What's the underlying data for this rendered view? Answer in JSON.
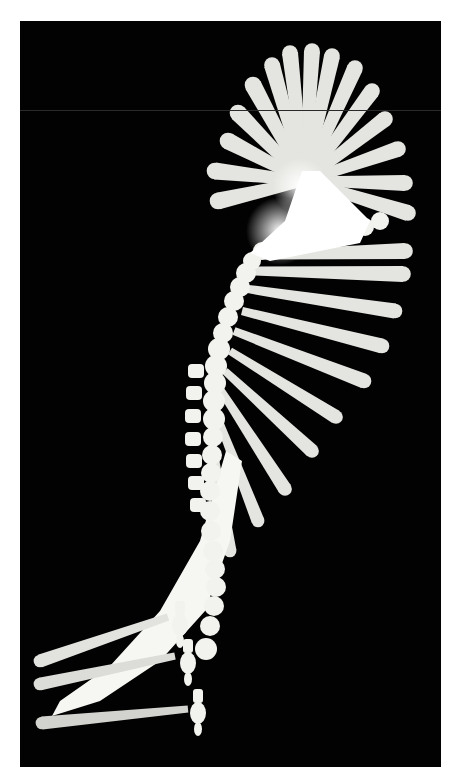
{
  "image": {
    "description": "Stroboscopic multiple-exposure photograph of a swinging hammer on black background",
    "frame": {
      "border_color": "#ffffff",
      "background_color": "#020202",
      "left": 20,
      "top": 21,
      "width": 421,
      "height": 746
    },
    "colors": {
      "handle": "#e4e4e0",
      "handle_bright": "#f6f6f2",
      "head": "#f2f2ee",
      "glow": "#ffffff",
      "lower_handle": "#d6d6d2"
    }
  },
  "shapes": {
    "upper_fan": {
      "hub": [
        285,
        160
      ],
      "handles": [
        {
          "end": [
            198,
            180
          ],
          "w": 17
        },
        {
          "end": [
            195,
            150
          ],
          "w": 17
        },
        {
          "end": [
            208,
            120
          ],
          "w": 17
        },
        {
          "end": [
            218,
            92
          ],
          "w": 17
        },
        {
          "end": [
            233,
            64
          ],
          "w": 17
        },
        {
          "end": [
            252,
            44
          ],
          "w": 16
        },
        {
          "end": [
            270,
            32
          ],
          "w": 16
        },
        {
          "end": [
            292,
            30
          ],
          "w": 16
        },
        {
          "end": [
            312,
            35
          ],
          "w": 16
        },
        {
          "end": [
            335,
            47
          ],
          "w": 16
        },
        {
          "end": [
            352,
            70
          ],
          "w": 16
        },
        {
          "end": [
            365,
            98
          ],
          "w": 16
        },
        {
          "end": [
            378,
            128
          ],
          "w": 16
        },
        {
          "end": [
            385,
            162
          ],
          "w": 16
        },
        {
          "end": [
            388,
            192
          ],
          "w": 16
        }
      ]
    },
    "lower_fan": {
      "handles": [
        {
          "start": [
            240,
            234
          ],
          "end": [
            385,
            230
          ],
          "w": 16
        },
        {
          "start": [
            235,
            250
          ],
          "end": [
            383,
            253
          ],
          "w": 16
        },
        {
          "start": [
            228,
            268
          ],
          "end": [
            375,
            290
          ],
          "w": 15
        },
        {
          "start": [
            222,
            290
          ],
          "end": [
            362,
            325
          ],
          "w": 15
        },
        {
          "start": [
            214,
            310
          ],
          "end": [
            344,
            360
          ],
          "w": 15
        },
        {
          "start": [
            210,
            330
          ],
          "end": [
            316,
            396
          ],
          "w": 14
        },
        {
          "start": [
            205,
            350
          ],
          "end": [
            292,
            430
          ],
          "w": 14
        },
        {
          "start": [
            200,
            368
          ],
          "end": [
            265,
            468
          ],
          "w": 14
        },
        {
          "start": [
            195,
            390
          ],
          "end": [
            238,
            500
          ],
          "w": 13
        },
        {
          "start": [
            192,
            420
          ],
          "end": [
            210,
            530
          ],
          "w": 13
        }
      ]
    },
    "head_chain": [
      [
        360,
        200,
        9
      ],
      [
        345,
        206,
        9
      ],
      [
        330,
        210,
        9
      ],
      [
        315,
        212,
        9
      ],
      [
        300,
        214,
        9
      ],
      [
        286,
        215,
        9
      ],
      [
        270,
        218,
        9
      ],
      [
        255,
        222,
        9
      ],
      [
        242,
        230,
        9
      ],
      [
        232,
        240,
        9
      ],
      [
        226,
        252,
        10
      ],
      [
        220,
        266,
        10
      ],
      [
        214,
        280,
        10
      ],
      [
        208,
        296,
        10
      ],
      [
        203,
        312,
        10
      ],
      [
        199,
        328,
        11
      ],
      [
        196,
        345,
        11
      ],
      [
        195,
        362,
        11
      ],
      [
        194,
        380,
        11
      ],
      [
        194,
        398,
        11
      ],
      [
        193,
        416,
        10
      ],
      [
        192,
        434,
        10
      ],
      [
        191,
        452,
        10
      ],
      [
        190,
        470,
        10
      ],
      [
        190,
        490,
        10
      ],
      [
        191,
        510,
        10
      ],
      [
        193,
        530,
        10
      ],
      [
        195,
        548,
        10
      ],
      [
        196,
        566,
        10
      ],
      [
        194,
        585,
        10
      ],
      [
        190,
        605,
        10
      ],
      [
        186,
        628,
        11
      ]
    ],
    "head_nubs": [
      [
        178,
        350
      ],
      [
        176,
        372
      ],
      [
        175,
        395
      ],
      [
        175,
        418
      ],
      [
        176,
        440
      ],
      [
        178,
        462
      ],
      [
        180,
        484
      ]
    ],
    "sweep_band": {
      "points": [
        [
          206,
          430
        ],
        [
          180,
          520
        ],
        [
          140,
          590
        ],
        [
          90,
          645
        ],
        [
          40,
          680
        ],
        [
          32,
          695
        ],
        [
          80,
          680
        ],
        [
          140,
          640
        ],
        [
          185,
          590
        ],
        [
          210,
          520
        ],
        [
          222,
          440
        ]
      ]
    },
    "bottom_hammers": [
      {
        "handle_start": [
          22,
          702
        ],
        "handle_end": [
          168,
          688
        ],
        "w": 13,
        "head": [
          178,
          692
        ],
        "color": "#d2d2ce"
      },
      {
        "handle_start": [
          20,
          663
        ],
        "handle_end": [
          155,
          635
        ],
        "w": 13,
        "head": [
          168,
          642
        ],
        "color": "#dcdcd8"
      },
      {
        "handle_start": [
          20,
          640
        ],
        "handle_end": [
          148,
          596
        ],
        "w": 13,
        "head": [
          160,
          604
        ],
        "color": "#e2e2de"
      }
    ],
    "glow": [
      [
        280,
        165,
        28
      ],
      [
        260,
        210,
        34
      ],
      [
        300,
        200,
        26
      ]
    ]
  }
}
